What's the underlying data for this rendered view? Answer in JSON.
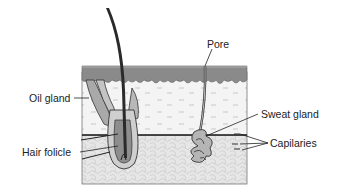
{
  "diagram": {
    "title": "",
    "labels": {
      "pore": "Pore",
      "oil_gland": "Oil gland",
      "sweat_gland": "Sweat gland",
      "hair_folicle": "Hair folicle",
      "capilaries": "Capilaries"
    },
    "colors": {
      "epidermis": "#8a8a8a",
      "dermis": "#f3f3f3",
      "subcutaneous": "#e4e4e4",
      "hair": "#2a2a2a",
      "outline": "#333333",
      "background": "#ffffff"
    }
  }
}
